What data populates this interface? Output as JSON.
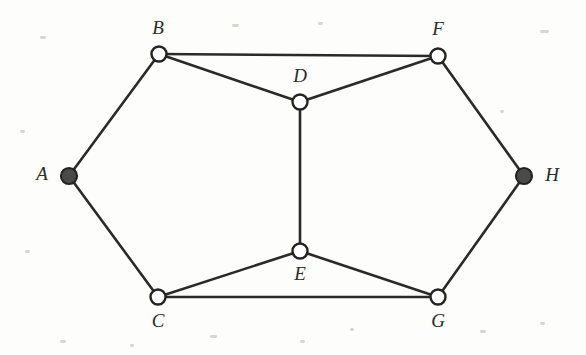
{
  "figure": {
    "kind": "undirected-graph-diagram",
    "background_color": "#fdfdfb",
    "edge_color": "#2a2a2a",
    "open_node_fill": "#ffffff",
    "filled_node_fill": "#4a4a4a",
    "node_stroke_color": "#232323",
    "label_color": "#2b2b2b",
    "width": 586,
    "height": 355
  },
  "nodes": [
    {
      "id": "A",
      "label": "A",
      "x": 69,
      "y": 176,
      "r": 8,
      "style": "filled",
      "label_x": 42,
      "label_y": 176
    },
    {
      "id": "B",
      "label": "B",
      "x": 159,
      "y": 54,
      "r": 7.5,
      "style": "open",
      "label_x": 158,
      "label_y": 30
    },
    {
      "id": "C",
      "label": "C",
      "x": 158,
      "y": 297,
      "r": 7.5,
      "style": "open",
      "label_x": 158,
      "label_y": 323
    },
    {
      "id": "D",
      "label": "D",
      "x": 300,
      "y": 102,
      "r": 7.5,
      "style": "open",
      "label_x": 300,
      "label_y": 78
    },
    {
      "id": "E",
      "label": "E",
      "x": 300,
      "y": 251,
      "r": 7.5,
      "style": "open",
      "label_x": 300,
      "label_y": 276
    },
    {
      "id": "F",
      "label": "F",
      "x": 438,
      "y": 56,
      "r": 7.5,
      "style": "open",
      "label_x": 438,
      "label_y": 31
    },
    {
      "id": "G",
      "label": "G",
      "x": 438,
      "y": 297,
      "r": 7.5,
      "style": "open",
      "label_x": 438,
      "label_y": 323
    },
    {
      "id": "H",
      "label": "H",
      "x": 524,
      "y": 176,
      "r": 8,
      "style": "filled",
      "label_x": 552,
      "label_y": 177
    }
  ],
  "edges": [
    {
      "id": "A-B",
      "from": "A",
      "to": "B"
    },
    {
      "id": "A-C",
      "from": "A",
      "to": "C"
    },
    {
      "id": "B-F",
      "from": "B",
      "to": "F"
    },
    {
      "id": "B-D",
      "from": "B",
      "to": "D"
    },
    {
      "id": "D-F",
      "from": "D",
      "to": "F"
    },
    {
      "id": "D-E",
      "from": "D",
      "to": "E"
    },
    {
      "id": "C-E",
      "from": "C",
      "to": "E"
    },
    {
      "id": "C-G",
      "from": "C",
      "to": "G"
    },
    {
      "id": "E-G",
      "from": "E",
      "to": "G"
    },
    {
      "id": "F-H",
      "from": "F",
      "to": "H"
    },
    {
      "id": "G-H",
      "from": "G",
      "to": "H"
    }
  ],
  "specks": [
    {
      "x": 40,
      "y": 36,
      "w": 6,
      "h": 3
    },
    {
      "x": 232,
      "y": 24,
      "w": 7,
      "h": 3
    },
    {
      "x": 318,
      "y": 22,
      "w": 5,
      "h": 3
    },
    {
      "x": 540,
      "y": 30,
      "w": 9,
      "h": 3
    },
    {
      "x": 20,
      "y": 130,
      "w": 5,
      "h": 3
    },
    {
      "x": 500,
      "y": 110,
      "w": 4,
      "h": 3
    },
    {
      "x": 25,
      "y": 250,
      "w": 5,
      "h": 3
    },
    {
      "x": 210,
      "y": 335,
      "w": 7,
      "h": 3
    },
    {
      "x": 300,
      "y": 340,
      "w": 5,
      "h": 3
    },
    {
      "x": 350,
      "y": 328,
      "w": 4,
      "h": 3
    },
    {
      "x": 480,
      "y": 330,
      "w": 6,
      "h": 3
    },
    {
      "x": 540,
      "y": 322,
      "w": 5,
      "h": 3
    },
    {
      "x": 60,
      "y": 340,
      "w": 6,
      "h": 3
    },
    {
      "x": 130,
      "y": 344,
      "w": 4,
      "h": 3
    }
  ]
}
